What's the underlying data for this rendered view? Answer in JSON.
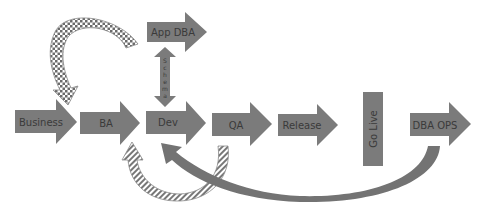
{
  "diagram": {
    "colors": {
      "arrow_fill": "#7b7b7b",
      "arrow_text": "#3a3a3a",
      "background": "#ffffff"
    },
    "flow": [
      {
        "id": "business",
        "label": "Business"
      },
      {
        "id": "ba",
        "label": "BA"
      },
      {
        "id": "dev",
        "label": "Dev"
      },
      {
        "id": "qa",
        "label": "QA"
      },
      {
        "id": "release",
        "label": "Release"
      },
      {
        "id": "go-live",
        "label": "Go Live"
      },
      {
        "id": "dba-ops",
        "label": "DBA OPS"
      }
    ],
    "app_dba": {
      "label": "App DBA"
    },
    "schema_link": {
      "letters": [
        "S",
        "c",
        "h",
        "e",
        "m",
        "a"
      ]
    },
    "feedback_arrows": [
      {
        "id": "app-dba-to-business",
        "from": "App DBA",
        "to": "BA",
        "pattern": "checkered"
      },
      {
        "id": "qa-to-ba",
        "from": "QA",
        "to": "BA",
        "pattern": "striped"
      },
      {
        "id": "dba-ops-to-dev",
        "from": "DBA OPS",
        "to": "Dev",
        "pattern": "solid"
      }
    ]
  }
}
